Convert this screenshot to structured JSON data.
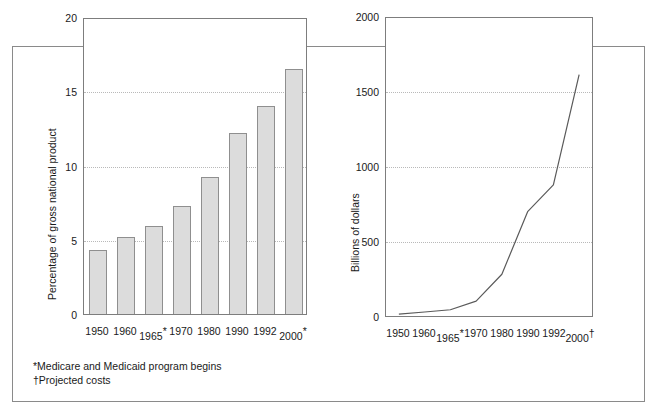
{
  "figure": {
    "footnotes": [
      "*Medicare and Medicaid program begins",
      "†Projected costs"
    ]
  },
  "chart_data": [
    {
      "type": "bar",
      "panel": "left",
      "title": "",
      "xlabel": "",
      "ylabel": "Percentage of gross national product",
      "categories": [
        "1950",
        "1960",
        "1965*",
        "1970",
        "1980",
        "1990",
        "1992",
        "2000*"
      ],
      "values": [
        4.3,
        5.2,
        5.9,
        7.3,
        9.2,
        12.2,
        14.0,
        16.5
      ],
      "ylim": [
        0,
        20
      ],
      "yticks": [
        0,
        5,
        10,
        15,
        20
      ],
      "ytick_labels": [
        "0",
        "5",
        "10",
        "15",
        "20"
      ],
      "grid": true,
      "gridlines_at": [
        5,
        10,
        15
      ],
      "legend": "none",
      "bar_color": "#dcdcdc",
      "bar_edge_color": "#8f8f8f"
    },
    {
      "type": "line",
      "panel": "right",
      "title": "",
      "xlabel": "",
      "ylabel": "Billions of dollars",
      "categories": [
        "1950",
        "1960",
        "1965*",
        "1970",
        "1980",
        "1990",
        "1992",
        "2000†"
      ],
      "values": [
        12,
        27,
        42,
        100,
        280,
        700,
        880,
        1620
      ],
      "ylim": [
        0,
        2000
      ],
      "yticks": [
        0,
        500,
        1000,
        1500,
        2000
      ],
      "ytick_labels": [
        "0",
        "500",
        "1000",
        "1500",
        "2000"
      ],
      "grid": true,
      "gridlines_at": [
        500,
        1000,
        1500
      ],
      "legend": "none",
      "line_color": "#5a5a5a"
    }
  ]
}
